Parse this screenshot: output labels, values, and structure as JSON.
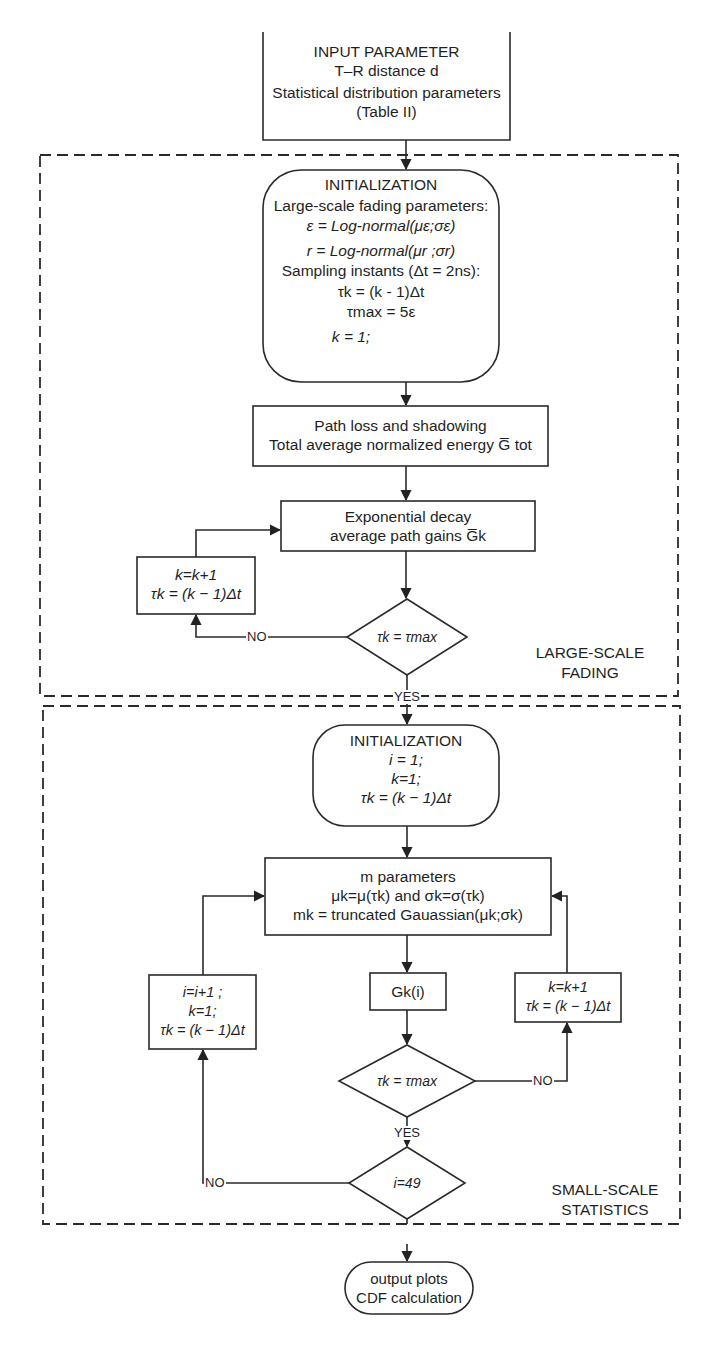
{
  "input_box": {
    "lines": [
      "INPUT PARAMETER",
      "T–R distance d",
      "Statistical distribution parameters",
      "(Table II)"
    ]
  },
  "regions": {
    "large_scale": {
      "label_line1": "LARGE-SCALE",
      "label_line2": "FADING"
    },
    "small_scale": {
      "label_line1": "SMALL-SCALE",
      "label_line2": "STATISTICS"
    }
  },
  "init1": {
    "title": "INITIALIZATION",
    "lines": [
      "Large-scale fading parameters:",
      "ε = Log-normal(με;σε)",
      "r = Log-normal(μr ;σr)",
      "Sampling instants (Δt = 2ns):",
      "τk = (k - 1)Δt",
      "τmax = 5ε",
      "k = 1;"
    ]
  },
  "path_loss": {
    "line1": "Path loss and shadowing",
    "line2": "Total average normalized energy G̅ tot"
  },
  "exp_decay": {
    "line1": "Exponential decay",
    "line2": "average path gains G̅k"
  },
  "loop1": {
    "line1": "k=k+1",
    "line2": "τk = (k − 1)Δt"
  },
  "decision1": {
    "text": "τk = τmax",
    "no_label": "NO",
    "yes_label": "YES"
  },
  "init2": {
    "title": "INITIALIZATION",
    "lines": [
      "i = 1;",
      "k=1;",
      "τk = (k − 1)Δt"
    ]
  },
  "m_params": {
    "lines": [
      "m parameters",
      "μk=μ(τk) and σk=σ(τk)",
      "mk = truncated Gauassian(μk;σk)"
    ]
  },
  "g_box": {
    "text": "Gk(i)"
  },
  "loop2_right": {
    "line1": "k=k+1",
    "line2": "τk = (k − 1)Δt"
  },
  "loop2_left": {
    "line1": "i=i+1 ;",
    "line2": "k=1;",
    "line3": "τk = (k − 1)Δt"
  },
  "decision2": {
    "text": "τk = τmax",
    "no_label": "NO",
    "yes_label": "YES"
  },
  "decision3": {
    "text": "i=49",
    "no_label": "NO"
  },
  "output": {
    "line1": "output plots",
    "line2": "CDF calculation"
  },
  "colors": {
    "stroke": "#2a2a2a",
    "text": "#1f1f1f",
    "background": "#ffffff"
  }
}
